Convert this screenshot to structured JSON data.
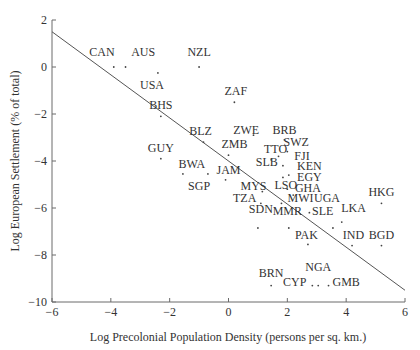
{
  "chart_data": {
    "type": "scatter",
    "title": "",
    "xlabel": "Log Precolonial Population Density (persons per sq. km.)",
    "ylabel": "Log European Settlement (% of total)",
    "xlim": [
      -6,
      6
    ],
    "ylim": [
      -10,
      2
    ],
    "xticks": [
      -6,
      -4,
      -2,
      0,
      2,
      4,
      6
    ],
    "yticks": [
      2,
      0,
      -2,
      -4,
      -6,
      -8,
      -10
    ],
    "grid": false,
    "legend": null,
    "fit_line": {
      "x": [
        -6,
        6
      ],
      "y": [
        1.5,
        -9.5
      ]
    },
    "points": [
      {
        "label": "CAN",
        "x": -3.9,
        "y": 0.0,
        "lx": -4.3,
        "ly": 0.45
      },
      {
        "label": "AUS",
        "x": -3.5,
        "y": 0.0,
        "lx": -2.9,
        "ly": 0.45
      },
      {
        "label": "NZL",
        "x": -1.0,
        "y": 0.0,
        "lx": -1.0,
        "ly": 0.45
      },
      {
        "label": "USA",
        "x": -2.4,
        "y": -0.25,
        "lx": -2.6,
        "ly": -0.95
      },
      {
        "label": "ZAF",
        "x": 0.2,
        "y": -1.5,
        "lx": 0.25,
        "ly": -1.2
      },
      {
        "label": "BHS",
        "x": -2.3,
        "y": -2.1,
        "lx": -2.3,
        "ly": -1.8
      },
      {
        "label": "BLZ",
        "x": -0.85,
        "y": -3.2,
        "lx": -0.95,
        "ly": -2.9
      },
      {
        "label": "ZWE",
        "x": 0.85,
        "y": -2.9,
        "lx": 0.6,
        "ly": -2.85
      },
      {
        "label": "BRB",
        "x": 1.9,
        "y": -3.1,
        "lx": 1.9,
        "ly": -2.85
      },
      {
        "label": "SWZ",
        "x": 2.0,
        "y": -3.6,
        "lx": 2.3,
        "ly": -3.35
      },
      {
        "label": "ZMB",
        "x": 0.0,
        "y": -3.75,
        "lx": 0.2,
        "ly": -3.45
      },
      {
        "label": "TTO",
        "x": 1.7,
        "y": -3.8,
        "lx": 1.6,
        "ly": -3.65
      },
      {
        "label": "FJI",
        "x": 1.85,
        "y": -4.2,
        "lx": 2.5,
        "ly": -3.95
      },
      {
        "label": "GUY",
        "x": -2.3,
        "y": -3.9,
        "lx": -2.3,
        "ly": -3.6
      },
      {
        "label": "SLB",
        "x": 1.45,
        "y": -3.95,
        "lx": 1.3,
        "ly": -4.2
      },
      {
        "label": "KEN",
        "x": 2.05,
        "y": -4.6,
        "lx": 2.75,
        "ly": -4.4
      },
      {
        "label": "BWA",
        "x": -1.55,
        "y": -4.55,
        "lx": -1.25,
        "ly": -4.3
      },
      {
        "label": "JAM",
        "x": -0.1,
        "y": -4.8,
        "lx": 0.0,
        "ly": -4.55
      },
      {
        "label": "EGY",
        "x": 1.85,
        "y": -4.7,
        "lx": 2.75,
        "ly": -4.85
      },
      {
        "label": "SGP",
        "x": -0.7,
        "y": -4.55,
        "lx": -1.0,
        "ly": -5.25
      },
      {
        "label": "MYS",
        "x": 1.15,
        "y": -5.3,
        "lx": 0.85,
        "ly": -5.25
      },
      {
        "label": "LSO",
        "x": 2.0,
        "y": -5.2,
        "lx": 1.95,
        "ly": -5.2
      },
      {
        "label": "GHA",
        "x": 2.2,
        "y": -5.45,
        "lx": 2.7,
        "ly": -5.3
      },
      {
        "label": "TZA",
        "x": 1.1,
        "y": -5.8,
        "lx": 0.55,
        "ly": -5.75
      },
      {
        "label": "MWI",
        "x": 1.8,
        "y": -5.8,
        "lx": 2.45,
        "ly": -5.75
      },
      {
        "label": "UGA",
        "x": 2.75,
        "y": -6.2,
        "lx": 3.35,
        "ly": -5.75
      },
      {
        "label": "SDN",
        "x": 1.0,
        "y": -6.85,
        "lx": 1.1,
        "ly": -6.2
      },
      {
        "label": "MMR",
        "x": 2.05,
        "y": -6.85,
        "lx": 2.0,
        "ly": -6.3
      },
      {
        "label": "SLE",
        "x": 3.55,
        "y": -6.85,
        "lx": 3.2,
        "ly": -6.3
      },
      {
        "label": "LKA",
        "x": 3.85,
        "y": -6.6,
        "lx": 4.25,
        "ly": -6.15
      },
      {
        "label": "HKG",
        "x": 5.2,
        "y": -5.8,
        "lx": 5.2,
        "ly": -5.5
      },
      {
        "label": "PAK",
        "x": 2.7,
        "y": -7.55,
        "lx": 2.65,
        "ly": -7.3
      },
      {
        "label": "IND",
        "x": 4.2,
        "y": -7.6,
        "lx": 4.25,
        "ly": -7.3
      },
      {
        "label": "BGD",
        "x": 5.2,
        "y": -7.6,
        "lx": 5.2,
        "ly": -7.3
      },
      {
        "label": "BRN",
        "x": 1.45,
        "y": -9.3,
        "lx": 1.45,
        "ly": -8.95
      },
      {
        "label": "NGA",
        "x": 3.05,
        "y": -9.3,
        "lx": 3.05,
        "ly": -8.7
      },
      {
        "label": "CYP",
        "x": 2.85,
        "y": -9.3,
        "lx": 2.25,
        "ly": -9.3
      },
      {
        "label": "GMB",
        "x": 3.4,
        "y": -9.3,
        "lx": 4.0,
        "ly": -9.3
      }
    ]
  }
}
